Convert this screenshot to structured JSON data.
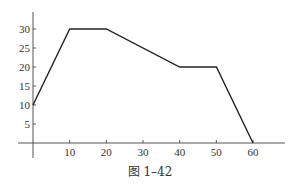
{
  "figure": {
    "caption": "图 1–42"
  },
  "chart_data": {
    "type": "line",
    "title": "",
    "xlabel": "",
    "ylabel": "",
    "x": [
      0,
      10,
      20,
      40,
      50,
      60
    ],
    "series": [
      {
        "name": "",
        "values": [
          10,
          30,
          30,
          20,
          20,
          0
        ]
      }
    ],
    "xticks": [
      10,
      20,
      30,
      40,
      50,
      60
    ],
    "yticks": [
      5,
      10,
      15,
      20,
      25,
      30
    ],
    "xlim": [
      -4,
      69
    ],
    "ylim": [
      -4,
      35
    ],
    "grid": false,
    "legend": null,
    "colors": {
      "line": "#222222",
      "axis": "#555555"
    }
  }
}
